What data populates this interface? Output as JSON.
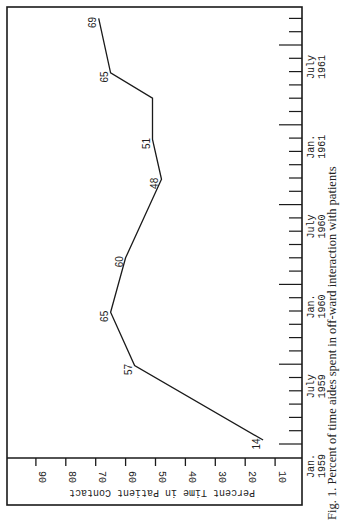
{
  "chart_data": {
    "type": "line",
    "orientation": "rotated-90-clockwise",
    "title": "",
    "caption": "Fig. 1. Percent of time aides spent in off-ward interaction with patients",
    "ylabel": "Percent Time in Patient Contact",
    "xlabel": "",
    "ylim": [
      0,
      95
    ],
    "yticks": [
      10,
      20,
      30,
      40,
      50,
      60,
      70,
      80,
      90
    ],
    "xticks": [
      {
        "label": [
          "Jan.",
          "1959"
        ],
        "month": 0
      },
      {
        "label": [
          "July",
          "1959"
        ],
        "month": 6
      },
      {
        "label": [
          "Jan.",
          "1960"
        ],
        "month": 12
      },
      {
        "label": [
          "July",
          "1960"
        ],
        "month": 18
      },
      {
        "label": [
          "Jan.",
          "1961"
        ],
        "month": 24
      },
      {
        "label": [
          "July",
          "1961"
        ],
        "month": 30
      }
    ],
    "minor_ticks_monthly": true,
    "grid": false,
    "series": [
      {
        "name": "Percent Time in Patient Contact",
        "points": [
          {
            "month": 0.3,
            "value": 14,
            "label": "14"
          },
          {
            "month": 5.9,
            "value": 57,
            "label": "57"
          },
          {
            "month": 9.9,
            "value": 65,
            "label": "65"
          },
          {
            "month": 14.0,
            "value": 60,
            "label": "60"
          },
          {
            "month": 19.9,
            "value": 48,
            "label": "48"
          },
          {
            "month": 22.9,
            "value": 51,
            "label": "51"
          },
          {
            "month": 26.0,
            "value": 51,
            "label": ""
          },
          {
            "month": 27.9,
            "value": 65,
            "label": "65"
          },
          {
            "month": 32.0,
            "value": 69,
            "label": "69"
          }
        ]
      }
    ]
  }
}
